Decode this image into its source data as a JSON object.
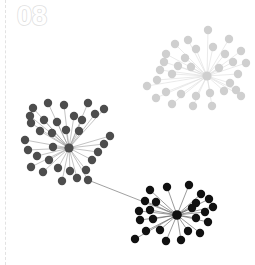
{
  "slide": {
    "number_label": "08"
  },
  "colors": {
    "background": "#ffffff",
    "divider": "#e2e2e2",
    "number_outline": "#e0e0e0",
    "cluster_light": "#cfcfcf",
    "cluster_light_edge": "#dcdcdc",
    "cluster_mid": "#4d4d4d",
    "cluster_mid_edge": "#9a9a9a",
    "cluster_dark": "#111111",
    "cluster_dark_edge": "#555555",
    "bridge_edge": "#777777"
  },
  "chart_data": {
    "type": "scatter",
    "title": "",
    "subtitle": "",
    "xlabel": "",
    "ylabel": "",
    "xlim": [
      0,
      255
    ],
    "ylim": [
      0,
      265
    ],
    "grid": false,
    "legend": null,
    "clusters": [
      {
        "name": "light-cluster",
        "color": "#cfcfcf",
        "edge_color": "#dcdcdc",
        "node_radius": 4.2,
        "hub": [
          207,
          76
        ],
        "hub_radius": 4.6,
        "nodes": [
          [
            188,
            40
          ],
          [
            208,
            30
          ],
          [
            229,
            39
          ],
          [
            241,
            51
          ],
          [
            246,
            63
          ],
          [
            175,
            44
          ],
          [
            166,
            54
          ],
          [
            164,
            62
          ],
          [
            160,
            70
          ],
          [
            157,
            80
          ],
          [
            196,
            49
          ],
          [
            213,
            47
          ],
          [
            225,
            54
          ],
          [
            233,
            62
          ],
          [
            238,
            74
          ],
          [
            185,
            58
          ],
          [
            178,
            66
          ],
          [
            172,
            74
          ],
          [
            191,
            67
          ],
          [
            219,
            68
          ],
          [
            230,
            83
          ],
          [
            236,
            90
          ],
          [
            241,
            96
          ],
          [
            224,
            91
          ],
          [
            210,
            93
          ],
          [
            196,
            96
          ],
          [
            181,
            94
          ],
          [
            166,
            92
          ],
          [
            156,
            98
          ],
          [
            172,
            104
          ],
          [
            193,
            106
          ],
          [
            212,
            106
          ],
          [
            147,
            86
          ]
        ]
      },
      {
        "name": "mid-cluster",
        "color": "#4d4d4d",
        "edge_color": "#9a9a9a",
        "node_radius": 4.2,
        "hub": [
          69,
          148
        ],
        "hub_radius": 4.6,
        "nodes": [
          [
            33,
            108
          ],
          [
            48,
            103
          ],
          [
            64,
            105
          ],
          [
            88,
            103
          ],
          [
            30,
            116
          ],
          [
            31,
            123
          ],
          [
            44,
            120
          ],
          [
            57,
            122
          ],
          [
            74,
            116
          ],
          [
            82,
            120
          ],
          [
            95,
            114
          ],
          [
            104,
            109
          ],
          [
            40,
            131
          ],
          [
            52,
            133
          ],
          [
            66,
            130
          ],
          [
            79,
            131
          ],
          [
            25,
            140
          ],
          [
            28,
            150
          ],
          [
            37,
            156
          ],
          [
            49,
            160
          ],
          [
            31,
            167
          ],
          [
            43,
            172
          ],
          [
            58,
            168
          ],
          [
            70,
            171
          ],
          [
            62,
            181
          ],
          [
            77,
            178
          ],
          [
            86,
            170
          ],
          [
            92,
            160
          ],
          [
            98,
            152
          ],
          [
            104,
            144
          ],
          [
            110,
            136
          ],
          [
            53,
            147
          ],
          [
            88,
            180
          ]
        ]
      },
      {
        "name": "dark-cluster",
        "color": "#111111",
        "edge_color": "#555555",
        "node_radius": 4.2,
        "hub": [
          177,
          215
        ],
        "hub_radius": 4.8,
        "nodes": [
          [
            150,
            190
          ],
          [
            167,
            187
          ],
          [
            189,
            185
          ],
          [
            201,
            194
          ],
          [
            145,
            201
          ],
          [
            156,
            202
          ],
          [
            196,
            203
          ],
          [
            209,
            199
          ],
          [
            139,
            211
          ],
          [
            150,
            210
          ],
          [
            192,
            208
          ],
          [
            205,
            212
          ],
          [
            140,
            220
          ],
          [
            153,
            219
          ],
          [
            196,
            218
          ],
          [
            208,
            222
          ],
          [
            146,
            231
          ],
          [
            160,
            230
          ],
          [
            188,
            231
          ],
          [
            200,
            233
          ],
          [
            166,
            241
          ],
          [
            181,
            240
          ],
          [
            135,
            239
          ],
          [
            213,
            207
          ]
        ]
      }
    ],
    "bridges": [
      {
        "from": [
          88,
          180
        ],
        "to": [
          177,
          215
        ],
        "color": "#777777"
      }
    ]
  }
}
